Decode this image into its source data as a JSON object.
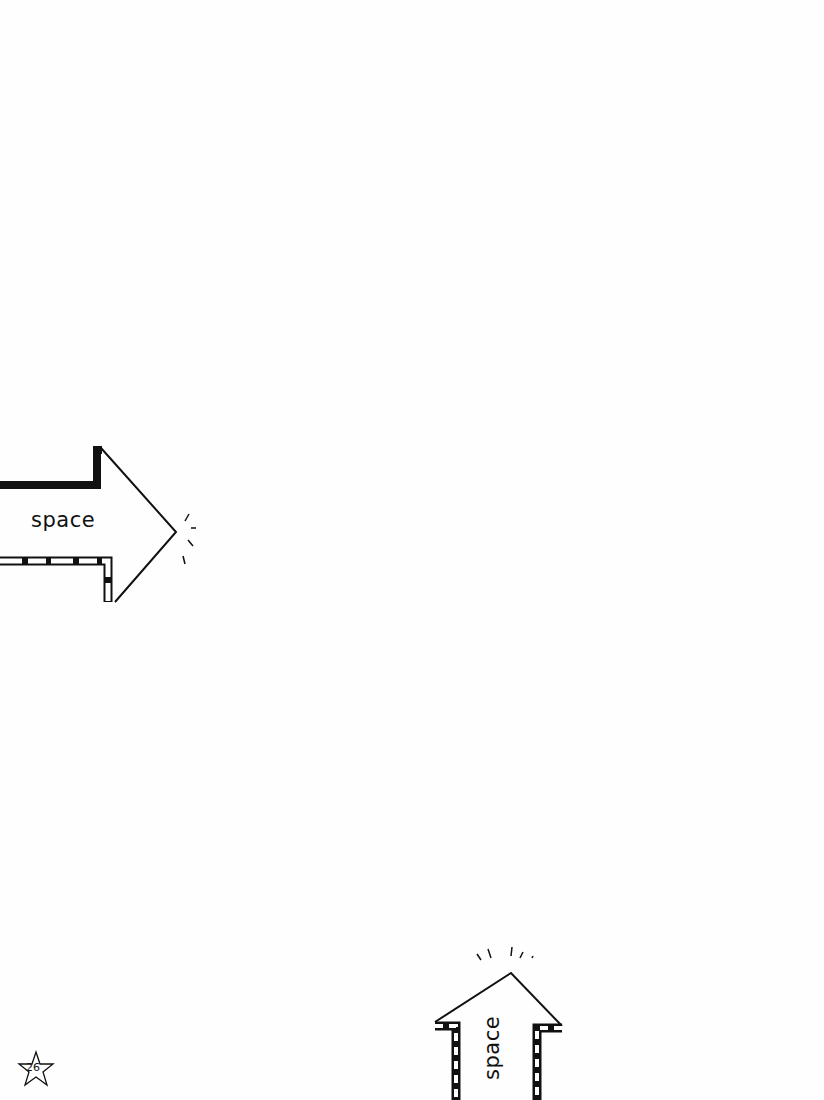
{
  "page": {
    "background": "#fefefe",
    "ink_color": "#111111",
    "page_number": "26"
  },
  "arrows": [
    {
      "id": "right-arrow",
      "direction": "right",
      "label": "space"
    },
    {
      "id": "up-arrow",
      "direction": "up",
      "label": "space"
    }
  ]
}
